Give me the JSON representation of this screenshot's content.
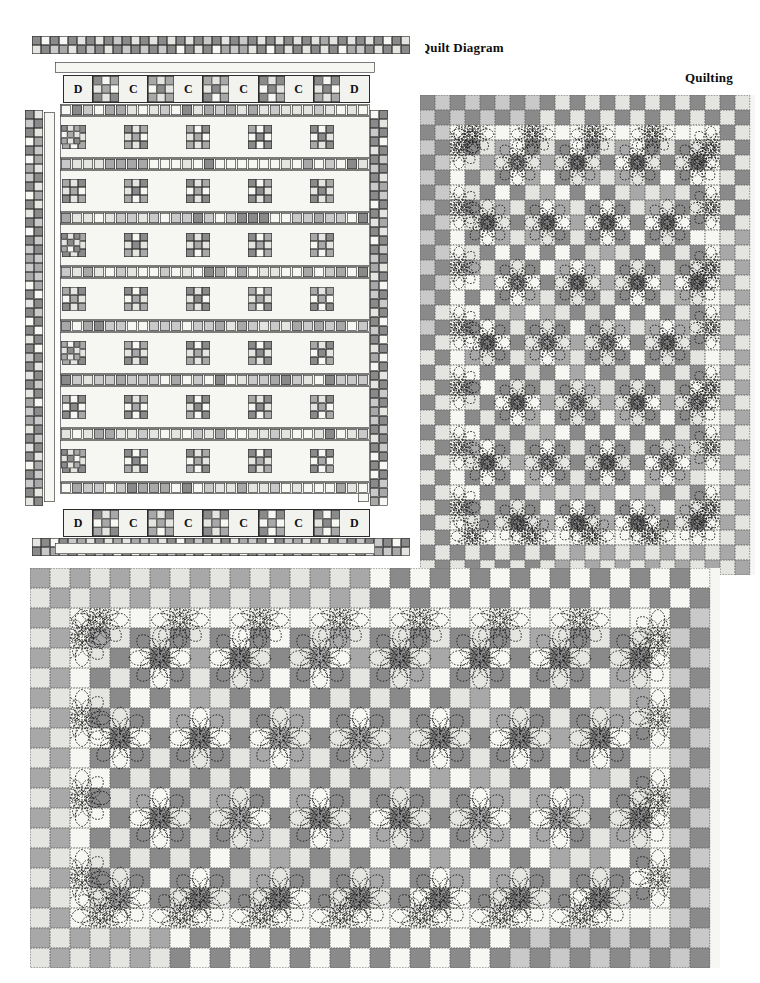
{
  "page": {
    "width": 760,
    "height": 983,
    "background": "#ffffff"
  },
  "labels": {
    "quilt_diagram": "Quilt Diagram",
    "quilting": "Quilting"
  },
  "palette": {
    "dark": "#8a8a8a",
    "medium": "#a8a8a8",
    "light": "#c9c9c9",
    "pale": "#e4e4e0",
    "white": "#f6f6f2",
    "outline": "#2b2b2b",
    "dash": "#1a1a1a",
    "page_bg": "#ffffff"
  },
  "quilt_diagram": {
    "name": "quilt-diagram",
    "x": 25,
    "y": 30,
    "width": 400,
    "height": 540,
    "outer_border": {
      "name": "pieced-checkerboard-border",
      "rows": 2,
      "cell": 9,
      "top": {
        "x": 32,
        "y": 36,
        "cols": 42
      },
      "bottom": {
        "x": 32,
        "y": 538,
        "cols": 42
      },
      "left": {
        "x": 25,
        "y": 110,
        "rows": 44
      },
      "right": {
        "x": 370,
        "y": 110,
        "rows": 44
      }
    },
    "inner_white_border": {
      "name": "inner-white-border",
      "top": {
        "x": 55,
        "y": 62,
        "w": 320,
        "h": 11
      },
      "bottom": {
        "x": 55,
        "y": 543,
        "w": 320,
        "h": 11
      },
      "left": {
        "x": 44,
        "y": 112,
        "w": 11,
        "h": 390
      },
      "right": {
        "x": 358,
        "y": 112,
        "w": 11,
        "h": 390
      }
    },
    "dc_rows": [
      {
        "name": "dc-row-top",
        "x": 63,
        "y": 75,
        "width": 307,
        "height": 28,
        "cells": [
          "D",
          "block",
          "C",
          "block",
          "C",
          "block",
          "C",
          "block",
          "C",
          "block",
          "D"
        ]
      },
      {
        "name": "dc-row-bottom",
        "x": 63,
        "y": 509,
        "width": 307,
        "height": 28,
        "cells": [
          "D",
          "block",
          "C",
          "block",
          "C",
          "block",
          "C",
          "block",
          "C",
          "block",
          "D"
        ]
      }
    ],
    "body": {
      "name": "quilt-body-rows",
      "x": 60,
      "y": 104,
      "width": 310,
      "height": 402,
      "sashing_height": 12,
      "block_height": 42,
      "block_rows": 7,
      "blocks_per_row": 5,
      "nine_patch_size": 24
    }
  },
  "quilting_right": {
    "name": "quilting-panel-right",
    "x": 420,
    "y": 95,
    "width": 335,
    "height": 480,
    "cell": 15,
    "cols": 22,
    "rows": 32,
    "border_rows": 2,
    "inner_border_cells": 1,
    "flower_spacing": 4,
    "description": "Checkerboard quilt top with dashed flower quilting motifs"
  },
  "quilting_bottom": {
    "name": "quilting-panel-bottom",
    "x": 30,
    "y": 568,
    "width": 690,
    "height": 400,
    "cell": 20,
    "cols": 34,
    "rows": 20,
    "border_rows": 2,
    "inner_border_cells": 1,
    "flower_spacing": 4,
    "description": "Checkerboard quilt top with dashed flower quilting motifs"
  },
  "legend": {
    "block_letters": [
      "D",
      "C"
    ],
    "note": "Letters mark corner (D) and sashing-square (C) units along the pieced border rows"
  }
}
